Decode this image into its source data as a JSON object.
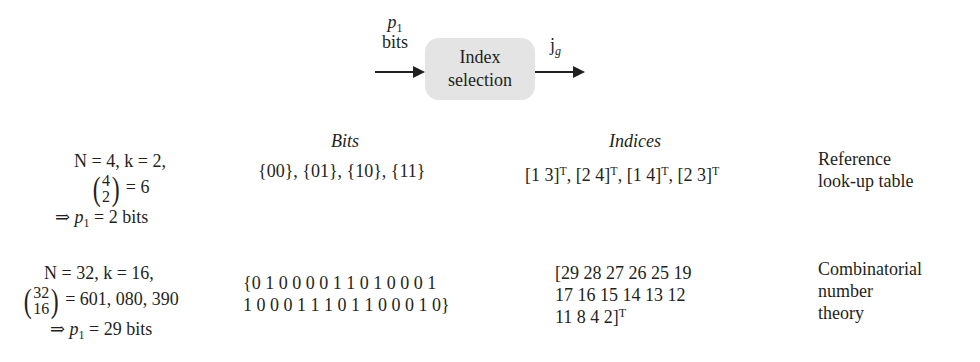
{
  "diagram": {
    "input_label_var": "p",
    "input_label_sub": "1",
    "input_label_unit": "bits",
    "block_line1": "Index",
    "block_line2": "selection",
    "output_label_var": "j",
    "output_label_sub": "g"
  },
  "table": {
    "headers": {
      "bits": "Bits",
      "indices": "Indices"
    },
    "rows": [
      {
        "params_line1": "N = 4, k = 2,",
        "binom_top": "4",
        "binom_bottom": "2",
        "binom_value": "= 6",
        "result_prefix": "⇒ ",
        "result_var": "p",
        "result_sub": "1",
        "result_value": " = 2 bits",
        "bits_line1": "{00}, {01}, {10}, {11}",
        "bits_line2": "",
        "indices": [
          {
            "vec": "[1 3]",
            "sup": "T",
            "sep": ", "
          },
          {
            "vec": "[2 4]",
            "sup": "T",
            "sep": ", "
          },
          {
            "vec": "[1 4]",
            "sup": "T",
            "sep": ", "
          },
          {
            "vec": "[2 3]",
            "sup": "T",
            "sep": ""
          }
        ],
        "method_line1": "Reference",
        "method_line2": "look-up table",
        "method_line3": ""
      },
      {
        "params_line1": "N = 32, k = 16,",
        "binom_top": "32",
        "binom_bottom": "16",
        "binom_value": "= 601, 080, 390",
        "result_prefix": "⇒ ",
        "result_var": "p",
        "result_sub": "1",
        "result_value": " = 29 bits",
        "bits_line1": "{0 1 0 0 0 0 1 1 0 1 0 0 0 1",
        "bits_line2": "1 0 0 0 1 1 1 0 1 1 0 0 0 1 0}",
        "indices_line1": "[29 28 27 26 25 19",
        "indices_line2": "17 16 15 14 13 12",
        "indices_line3": "11 8 4 2]",
        "indices_line3_sup": "T",
        "method_line1": "Combinatorial",
        "method_line2": "number",
        "method_line3": "theory"
      }
    ]
  }
}
